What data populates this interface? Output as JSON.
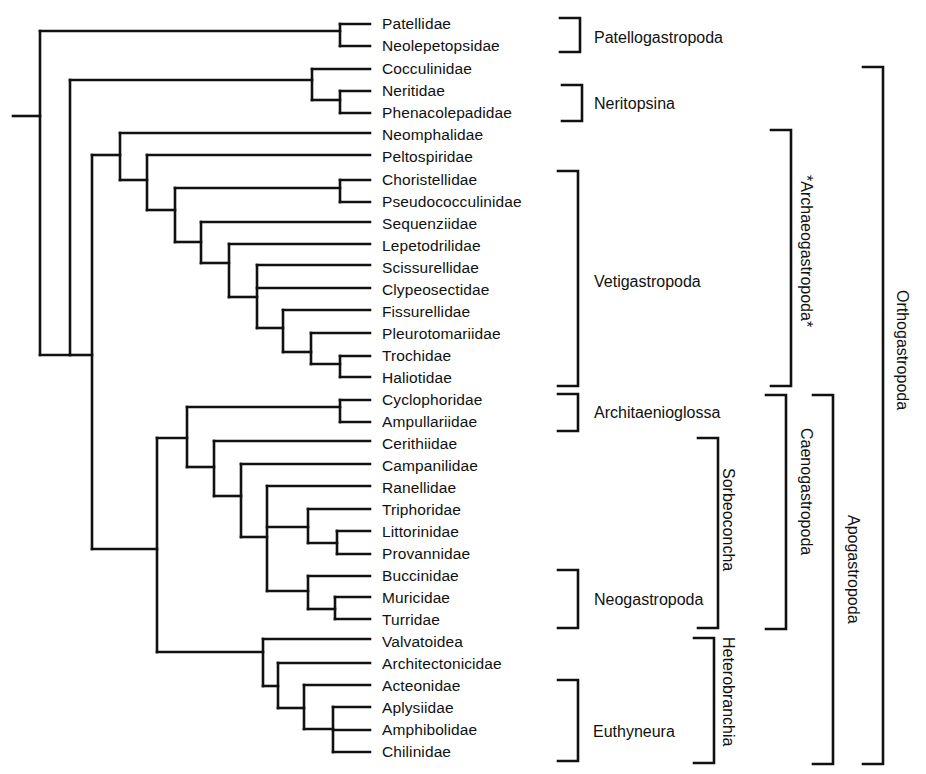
{
  "diagram": {
    "type": "cladogram",
    "leaves": [
      {
        "name": "Patellidae",
        "y": 24
      },
      {
        "name": "Neolepetopsidae",
        "y": 46
      },
      {
        "name": "Cocculinidae",
        "y": 69
      },
      {
        "name": "Neritidae",
        "y": 91
      },
      {
        "name": "Phenacolepadidae",
        "y": 113
      },
      {
        "name": "Neomphalidae",
        "y": 135
      },
      {
        "name": "Peltospiridae",
        "y": 157
      },
      {
        "name": "Choristellidae",
        "y": 180
      },
      {
        "name": "Pseudococculinidae",
        "y": 202
      },
      {
        "name": "Sequenziidae",
        "y": 224
      },
      {
        "name": "Lepetodrilidae",
        "y": 246
      },
      {
        "name": "Scissurellidae",
        "y": 268
      },
      {
        "name": "Clypeosectidae",
        "y": 290
      },
      {
        "name": "Fissurellidae",
        "y": 312
      },
      {
        "name": "Pleurotomariidae",
        "y": 334
      },
      {
        "name": "Trochidae",
        "y": 356
      },
      {
        "name": "Haliotidae",
        "y": 378
      },
      {
        "name": "Cyclophoridae",
        "y": 400
      },
      {
        "name": "Ampullariidae",
        "y": 422
      },
      {
        "name": "Cerithiidae",
        "y": 444
      },
      {
        "name": "Campanilidae",
        "y": 466
      },
      {
        "name": "Ranellidae",
        "y": 488
      },
      {
        "name": "Triphoridae",
        "y": 510
      },
      {
        "name": "Littorinidae",
        "y": 532
      },
      {
        "name": "Provannidae",
        "y": 554
      },
      {
        "name": "Buccinidae",
        "y": 576
      },
      {
        "name": "Muricidae",
        "y": 598
      },
      {
        "name": "Turridae",
        "y": 620
      },
      {
        "name": "Valvatoidea",
        "y": 642
      },
      {
        "name": "Architectonicidae",
        "y": 664
      },
      {
        "name": "Acteonidae",
        "y": 686
      },
      {
        "name": "Aplysiidae",
        "y": 708
      },
      {
        "name": "Amphibolidae",
        "y": 730
      },
      {
        "name": "Chilinidae",
        "y": 752
      }
    ],
    "clades_horizontal": [
      {
        "name": "Patellogastropoda",
        "from": "Patellidae",
        "to": "Neolepetopsidae",
        "bx": 580,
        "y1": 18,
        "y2": 52,
        "lx": 594,
        "ly": 29
      },
      {
        "name": "Neritopsina",
        "from": "Neritidae",
        "to": "Phenacolepadidae",
        "bx": 582,
        "y1": 85,
        "y2": 121,
        "lx": 594,
        "ly": 95
      },
      {
        "name": "Vetigastropoda",
        "from": "Choristellidae",
        "to": "Haliotidae",
        "bx": 578,
        "y1": 171,
        "y2": 386,
        "lx": 594,
        "ly": 273
      },
      {
        "name": "Architaenioglossa",
        "from": "Cyclophoridae",
        "to": "Ampullariidae",
        "bx": 578,
        "y1": 394,
        "y2": 431,
        "lx": 594,
        "ly": 404
      },
      {
        "name": "Neogastropoda",
        "from": "Buccinidae",
        "to": "Turridae",
        "bx": 578,
        "y1": 570,
        "y2": 628,
        "lx": 594,
        "ly": 591
      },
      {
        "name": "Euthyneura",
        "from": "Acteonidae",
        "to": "Chilinidae",
        "bx": 578,
        "y1": 680,
        "y2": 761,
        "lx": 593,
        "ly": 723
      }
    ],
    "clades_vertical": [
      {
        "name": "Sorbeoconcha",
        "from": "Cerithiidae",
        "to": "Turridae",
        "bx": 718,
        "y1": 438,
        "y2": 628,
        "lx": 737,
        "ly": 468
      },
      {
        "name": "Heterobranchia",
        "from": "Valvatoidea",
        "to": "Chilinidae",
        "bx": 714,
        "y1": 638,
        "y2": 763,
        "lx": 737,
        "ly": 637
      },
      {
        "name": "*Archaeogastropoda*",
        "from": "Neomphalidae",
        "to": "Haliotidae",
        "bx": 791,
        "y1": 130,
        "y2": 386,
        "lx": 815,
        "ly": 175
      },
      {
        "name": "Caenogastropoda",
        "from": "Cyclophoridae",
        "to": "Turridae",
        "bx": 786,
        "y1": 395,
        "y2": 629,
        "lx": 815,
        "ly": 428
      },
      {
        "name": "Apogastropoda",
        "from": "Cyclophoridae",
        "to": "Chilinidae",
        "bx": 833,
        "y1": 395,
        "y2": 764,
        "lx": 862,
        "ly": 515
      },
      {
        "name": "Orthogastropoda",
        "from": "Cocculinidae",
        "to": "Chilinidae",
        "bx": 883,
        "y1": 67,
        "y2": 764,
        "lx": 911,
        "ly": 290
      }
    ],
    "branches": [
      "M13 116 H40",
      "M40 31 V355",
      "M40 31 H340",
      "M340 24 V46",
      "M340 24 H370",
      "M340 46 H370",
      "M40 355 H70",
      "M70 80 V355",
      "M70 80 H312",
      "M312 69 V100",
      "M312 69 H370",
      "M312 100 H340",
      "M340 91 V113",
      "M340 91 H370",
      "M340 113 H370",
      "M70 355 H92",
      "M92 155 V549",
      "M92 155 H120",
      "M120 133 V180",
      "M120 133 H370",
      "M120 180 H147",
      "M147 155 V210",
      "M147 155 H370",
      "M147 210 H175",
      "M175 188 V242",
      "M175 188 H340",
      "M340 180 V202",
      "M340 180 H370",
      "M340 202 H370",
      "M175 242 H201",
      "M201 222 V263",
      "M201 222 H370",
      "M201 263 H229",
      "M229 244 V297",
      "M229 244 H370",
      "M229 297 H257",
      "M257 265 V328",
      "M257 265 H370",
      "M257 288 H370",
      "M257 328 H283",
      "M283 310 V352",
      "M283 310 H370",
      "M283 352 H311",
      "M311 333 V364",
      "M311 333 H370",
      "M311 364 H340",
      "M340 356 V377",
      "M340 356 H370",
      "M340 377 H370",
      "M92 549 H157",
      "M157 438 V652",
      "M157 438 H187",
      "M187 407 V467",
      "M187 407 H340",
      "M340 400 V422",
      "M340 400 H370",
      "M340 422 H370",
      "M187 467 H214",
      "M214 441 V496",
      "M214 441 H370",
      "M214 496 H241",
      "M241 464 V537",
      "M241 464 H370",
      "M241 537 H267",
      "M267 486 V591",
      "M267 486 H370",
      "M267 527 H308",
      "M308 509 V543",
      "M308 509 H370",
      "M308 543 H337",
      "M337 531 V554",
      "M337 531 H370",
      "M337 554 H370",
      "M267 591 H308",
      "M308 576 V609",
      "M308 576 H370",
      "M308 609 H335",
      "M335 597 V619",
      "M335 597 H370",
      "M335 619 H370",
      "M157 652 H263",
      "M263 639 V686",
      "M263 639 H370",
      "M263 686 H278",
      "M278 663 V708",
      "M278 663 H370",
      "M278 708 H304",
      "M304 685 V729",
      "M304 685 H370",
      "M304 729 H333",
      "M333 707 V752",
      "M333 707 H370",
      "M333 730 H370",
      "M333 752 H370"
    ],
    "colors": {
      "ink": "#111111",
      "background": "#ffffff"
    }
  }
}
